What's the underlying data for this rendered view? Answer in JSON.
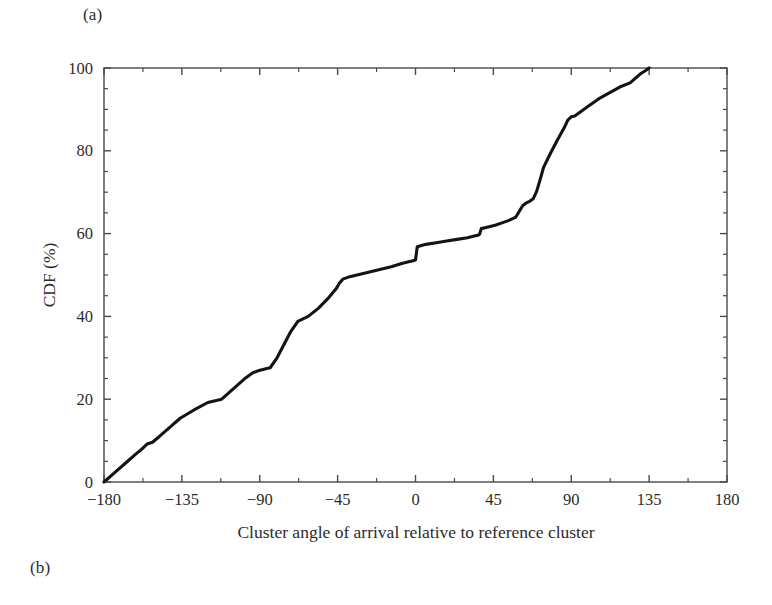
{
  "panels": {
    "label_a": "(a)",
    "label_b": "(b)"
  },
  "chart_data": {
    "type": "line",
    "title": "",
    "subtitle": "",
    "xlabel": "Cluster angle of arrival relative to reference cluster",
    "ylabel": "CDF (%)",
    "xlim": [
      -180,
      180
    ],
    "ylim": [
      0,
      100
    ],
    "xticks": [
      -180,
      -135,
      -90,
      -45,
      0,
      45,
      90,
      135,
      180
    ],
    "xtick_labels": [
      "−180",
      "−135",
      "−90",
      "−45",
      "0",
      "45",
      "90",
      "135",
      "180"
    ],
    "yticks": [
      0,
      20,
      40,
      60,
      80,
      100
    ],
    "ytick_labels": [
      "0",
      "20",
      "40",
      "60",
      "80",
      "100"
    ],
    "x_minor_interval": 11.25,
    "y_minor_interval": 5,
    "grid": false,
    "legend": null,
    "legend_position": "none",
    "line_color": "#141414",
    "line_width": 3.1,
    "series": [
      {
        "name": "CDF",
        "x": [
          -180,
          -174,
          -168,
          -162,
          -158,
          -155,
          -152,
          -148,
          -142,
          -136,
          -128,
          -120,
          -112,
          -104,
          -98,
          -94,
          -90,
          -88,
          -86,
          -84,
          -80,
          -76,
          -72,
          -68,
          -62,
          -56,
          -50,
          -46,
          -44,
          -42,
          -38,
          -32,
          -26,
          -20,
          -14,
          -8,
          -4,
          -2,
          0,
          1,
          6,
          12,
          18,
          24,
          30,
          34,
          36,
          37,
          38,
          42,
          46,
          50,
          54,
          58,
          60,
          62,
          64,
          66,
          68,
          70,
          72,
          74,
          78,
          82,
          86,
          88,
          90,
          92,
          96,
          100,
          106,
          112,
          118,
          124,
          130,
          133,
          135
        ],
        "y": [
          0,
          2.2,
          4.4,
          6.6,
          8.0,
          9.2,
          9.6,
          11.0,
          13.2,
          15.4,
          17.4,
          19.2,
          20.0,
          23.0,
          25.2,
          26.4,
          27.0,
          27.2,
          27.4,
          27.6,
          30.0,
          33.2,
          36.4,
          38.8,
          40.0,
          42.0,
          44.6,
          46.6,
          48.0,
          49.0,
          49.6,
          50.2,
          50.8,
          51.4,
          52.0,
          52.8,
          53.2,
          53.4,
          53.6,
          56.8,
          57.4,
          57.8,
          58.2,
          58.6,
          59.0,
          59.4,
          59.6,
          59.8,
          61.2,
          61.6,
          62.0,
          62.6,
          63.2,
          64.0,
          65.4,
          66.8,
          67.4,
          67.8,
          68.4,
          70.2,
          73.0,
          76.0,
          79.4,
          82.6,
          85.6,
          87.4,
          88.2,
          88.4,
          89.6,
          90.8,
          92.6,
          94.0,
          95.4,
          96.4,
          98.6,
          99.4,
          100
        ]
      }
    ]
  }
}
